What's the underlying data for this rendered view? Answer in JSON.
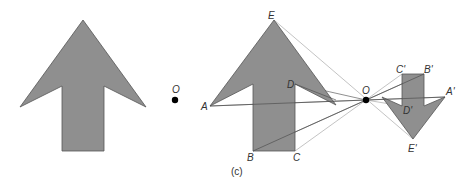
{
  "diagram": {
    "left_panel": {
      "center_label": "O"
    },
    "right_panel": {
      "caption": "(c)",
      "center_label": "O",
      "object_labels": {
        "A": "A",
        "B": "B",
        "C": "C",
        "D": "D",
        "E": "E"
      },
      "image_labels": {
        "A": "A'",
        "B": "B'",
        "C": "C'",
        "D": "D'",
        "E": "E'"
      }
    },
    "colors": {
      "shape_fill": "#8f8f8f",
      "ray": "#9a9a9a",
      "point": "#000000"
    }
  }
}
